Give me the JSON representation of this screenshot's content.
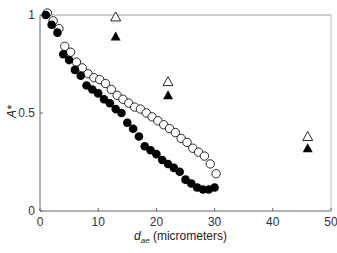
{
  "chart_data": {
    "type": "scatter",
    "title": "",
    "xlabel": "d_ae (micrometers)",
    "xlabel_main": "d",
    "xlabel_sub": "ae",
    "xlabel_rest": " (micrometers)",
    "ylabel": "A*",
    "xlim": [
      0,
      50
    ],
    "ylim": [
      0,
      1
    ],
    "xticks": [
      0,
      10,
      20,
      30,
      40,
      50
    ],
    "yticks": [
      0,
      0.5,
      1
    ],
    "ytick_labels": [
      "0",
      "0.5",
      "1"
    ],
    "grid": false,
    "legend": null,
    "series": [
      {
        "name": "open circles",
        "marker": "circle-open",
        "x": [
          1,
          2,
          3,
          4,
          5,
          6,
          7,
          8,
          9,
          10,
          11,
          12,
          13,
          14,
          15,
          16,
          17,
          18,
          19,
          20,
          21,
          22,
          23,
          24,
          25,
          26,
          27,
          28,
          29,
          30
        ],
        "y": [
          1.0,
          0.96,
          0.92,
          0.83,
          0.8,
          0.75,
          0.72,
          0.69,
          0.67,
          0.66,
          0.64,
          0.61,
          0.58,
          0.56,
          0.54,
          0.52,
          0.51,
          0.49,
          0.47,
          0.45,
          0.43,
          0.41,
          0.39,
          0.36,
          0.34,
          0.31,
          0.29,
          0.27,
          0.23,
          0.18
        ]
      },
      {
        "name": "filled circles",
        "marker": "circle-filled",
        "x": [
          1,
          2,
          3,
          4,
          5,
          6,
          7,
          8,
          9,
          10,
          11,
          12,
          13,
          14,
          15,
          16,
          17,
          18,
          19,
          20,
          21,
          22,
          23,
          24,
          25,
          26,
          27,
          28,
          29,
          30
        ],
        "y": [
          1.0,
          0.95,
          0.91,
          0.8,
          0.77,
          0.72,
          0.69,
          0.64,
          0.62,
          0.6,
          0.57,
          0.55,
          0.52,
          0.5,
          0.45,
          0.42,
          0.38,
          0.33,
          0.31,
          0.29,
          0.26,
          0.24,
          0.22,
          0.2,
          0.16,
          0.14,
          0.12,
          0.11,
          0.11,
          0.12
        ]
      },
      {
        "name": "open triangles",
        "marker": "triangle-open",
        "x": [
          13,
          22,
          46
        ],
        "y": [
          0.99,
          0.66,
          0.38
        ]
      },
      {
        "name": "filled triangles",
        "marker": "triangle-filled",
        "x": [
          13,
          22,
          46
        ],
        "y": [
          0.89,
          0.59,
          0.32
        ]
      }
    ]
  }
}
